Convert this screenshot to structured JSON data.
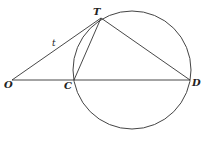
{
  "diagram": {
    "points": {
      "O": {
        "label": "O",
        "x": 12,
        "y": 80
      },
      "C": {
        "label": "C",
        "x": 74,
        "y": 80
      },
      "D": {
        "label": "D",
        "x": 190,
        "y": 80
      },
      "T": {
        "label": "T",
        "x": 101,
        "y": 18
      }
    },
    "circle": {
      "cx": 132,
      "cy": 70,
      "r": 59
    },
    "segments": [
      {
        "from": "O",
        "to": "T",
        "label": "t"
      },
      {
        "from": "O",
        "to": "D"
      },
      {
        "from": "C",
        "to": "T"
      },
      {
        "from": "T",
        "to": "D"
      }
    ],
    "labels": {
      "O": "O",
      "C": "C",
      "D": "D",
      "T": "T",
      "tangent": "t"
    }
  }
}
